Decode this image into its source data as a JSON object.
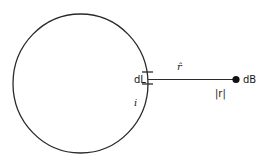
{
  "diagram": {
    "type": "biot-savart-current-loop",
    "labels": {
      "element": "dL",
      "unit_vector": "r̂",
      "field": "dB",
      "distance": "|r|",
      "current": "i"
    },
    "colors": {
      "stroke": "#2a2a2a",
      "background": "#ffffff"
    }
  }
}
